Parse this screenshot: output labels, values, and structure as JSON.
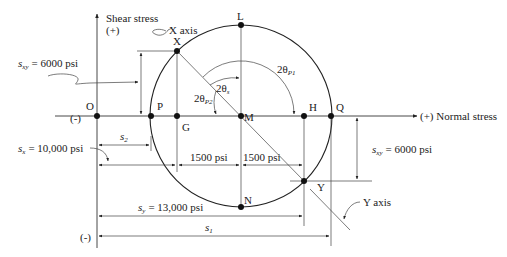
{
  "diagram": {
    "type": "mohrs-circle",
    "axes": {
      "vertical_label_line1": "Shear stress",
      "vertical_label_line2": "(+)",
      "vertical_negative": "(-)",
      "horizontal_negative": "(-)",
      "horizontal_label": "(+) Normal stress"
    },
    "points": {
      "O": "O",
      "P": "P",
      "G": "G",
      "M": "M",
      "H": "H",
      "Q": "Q",
      "L": "L",
      "N": "N",
      "X": "X",
      "Y": "Y"
    },
    "axis_labels": {
      "x_axis": "X axis",
      "y_axis": "Y axis"
    },
    "angles": {
      "two_theta_s": "2θ",
      "two_theta_s_sub": "s",
      "two_theta_p1": "2θ",
      "two_theta_p1_sub": "P1",
      "two_theta_p2": "2θ",
      "two_theta_p2_sub": "P2"
    },
    "dimensions": {
      "sxy_left_sym": "s",
      "sxy_left_sub": "xy",
      "sxy_left_val": "= 6000 psi",
      "sxy_right_sym": "s",
      "sxy_right_sub": "xy",
      "sxy_right_val": "= 6000 psi",
      "sx_sym": "s",
      "sx_sub": "x",
      "sx_val": "= 10,000 psi",
      "s2_sym": "s",
      "s2_sub": "2",
      "half_left": "1500 psi",
      "half_right": "1500 psi",
      "sy_sym": "s",
      "sy_sub": "y",
      "sy_val": "= 13,000 psi",
      "s1_sym": "s",
      "s1_sub": "1"
    }
  }
}
